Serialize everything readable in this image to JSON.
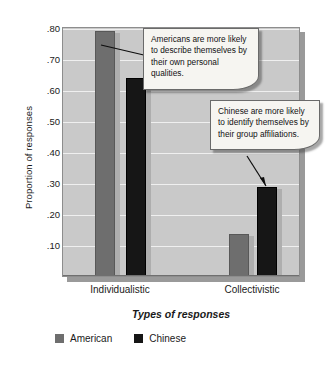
{
  "chart_data": {
    "type": "bar",
    "title": "",
    "xlabel": "Types of responses",
    "ylabel": "Proportion of responses",
    "categories": [
      "Individualistic",
      "Collectivistic"
    ],
    "series": [
      {
        "name": "American",
        "color": "#6e6e6e",
        "values": [
          0.78,
          0.13
        ]
      },
      {
        "name": "Chinese",
        "color": "#161616",
        "values": [
          0.63,
          0.28
        ]
      }
    ],
    "ylim": [
      0.0,
      0.8
    ],
    "yticks": [
      0.8,
      0.7,
      0.6,
      0.5,
      0.4,
      0.3,
      0.2,
      0.1
    ],
    "ytick_labels": [
      ".80",
      ".70",
      ".60",
      ".50",
      ".40",
      ".30",
      ".20",
      ".10"
    ],
    "grid": true,
    "legend_position": "bottom-left",
    "plot_background": "#c9c9c9",
    "gridline_color": "#efefef",
    "annotations": [
      {
        "id": "americans",
        "text": "Americans are more likely to describe themselves by their own personal qualities.",
        "points_to": {
          "series": "American",
          "category": "Individualistic",
          "value": 0.78
        }
      },
      {
        "id": "chinese",
        "text": "Chinese are more likely to identify themselves by their group affiliations.",
        "points_to": {
          "series": "Chinese",
          "category": "Collectivistic",
          "value": 0.28
        }
      }
    ]
  },
  "axes": {
    "y_title": "Proportion of responses",
    "x_title": "Types of responses",
    "y_tick_labels": [
      ".80",
      ".70",
      ".60",
      ".50",
      ".40",
      ".30",
      ".20",
      ".10"
    ],
    "x_tick_labels": [
      "Individualistic",
      "Collectivistic"
    ]
  },
  "legend": {
    "items": [
      {
        "label": "American",
        "color": "#6e6e6e"
      },
      {
        "label": "Chinese",
        "color": "#161616"
      }
    ]
  },
  "callouts": {
    "americans": "Americans are more likely to describe themselves by their own personal qualities.",
    "chinese": "Chinese are more likely to identify themselves by their group affiliations."
  }
}
